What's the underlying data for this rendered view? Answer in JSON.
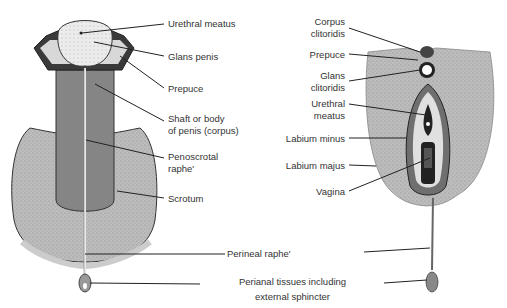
{
  "figure": {
    "male": {
      "labels": {
        "urethral_meatus": "Urethral meatus",
        "glans_penis": "Glans penis",
        "prepuce": "Prepuce",
        "shaft_line1": "Shaft or body",
        "shaft_line2": "of penis (corpus)",
        "penoscrotal_line1": "Penoscrotal",
        "penoscrotal_line2": "raphe'",
        "scrotum": "Scrotum"
      }
    },
    "female": {
      "labels": {
        "corpus_line1": "Corpus",
        "corpus_line2": "clitoridis",
        "prepuce": "Prepuce",
        "glans_line1": "Glans",
        "glans_line2": "clitoridis",
        "urethral_line1": "Urethral",
        "urethral_line2": "meatus",
        "labium_minus": "Labium minus",
        "labium_majus": "Labium majus",
        "vagina": "Vagina"
      }
    },
    "shared": {
      "perineal_raphe": "Perineal raphe'",
      "perianal_line1": "Perianal tissues including",
      "perianal_line2": "external sphincter"
    },
    "colors": {
      "tissue_fill": "#b5b5b5",
      "dark_tissue": "#7d7d7d",
      "outline": "#222222",
      "label_text": "#333333"
    }
  }
}
